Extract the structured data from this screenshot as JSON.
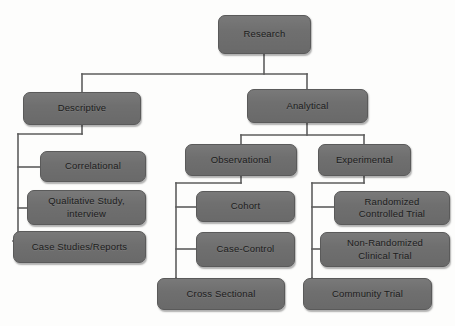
{
  "diagram": {
    "title": "Research",
    "type": "hierarchy-flowchart",
    "style": {
      "node_fill": "#6f6f6f",
      "node_border": "#5a5a5a",
      "connector_color": "#5d5d5d",
      "text_color": "#1c1c1c",
      "background": "#fdfdfc"
    },
    "nodes": [
      {
        "id": "research",
        "label": "Research",
        "level": 0,
        "x": 218,
        "y": 15,
        "w": 93,
        "h": 39
      },
      {
        "id": "descriptive",
        "label": "Descriptive",
        "level": 1,
        "x": 23,
        "y": 92,
        "w": 118,
        "h": 33
      },
      {
        "id": "analytical",
        "label": "Analytical",
        "level": 1,
        "x": 247,
        "y": 89,
        "w": 121,
        "h": 34
      },
      {
        "id": "correlational",
        "label": "Correlational",
        "level": 2,
        "x": 40,
        "y": 151,
        "w": 106,
        "h": 31
      },
      {
        "id": "qualitative",
        "label": "Qualitative Study,\ninterview",
        "line1": "Qualitative Study,",
        "line2": "interview",
        "level": 2,
        "x": 27,
        "y": 190,
        "w": 119,
        "h": 35
      },
      {
        "id": "case-studies",
        "label": "Case Studies/Reports",
        "level": 2,
        "x": 13,
        "y": 231,
        "w": 133,
        "h": 32
      },
      {
        "id": "observational",
        "label": "Observational",
        "level": 2,
        "x": 185,
        "y": 144,
        "w": 112,
        "h": 32
      },
      {
        "id": "experimental",
        "label": "Experimental",
        "level": 2,
        "x": 318,
        "y": 144,
        "w": 93,
        "h": 32
      },
      {
        "id": "cohort",
        "label": "Cohort",
        "level": 3,
        "x": 196,
        "y": 191,
        "w": 99,
        "h": 31
      },
      {
        "id": "case-control",
        "label": "Case-Control",
        "level": 3,
        "x": 196,
        "y": 232,
        "w": 99,
        "h": 35
      },
      {
        "id": "cross-sectional",
        "label": "Cross Sectional",
        "level": 3,
        "x": 157,
        "y": 278,
        "w": 128,
        "h": 32
      },
      {
        "id": "rct",
        "label": "Randomized\nControlled Trial",
        "line1": "Randomized",
        "line2": "Controlled Trial",
        "level": 3,
        "x": 334,
        "y": 191,
        "w": 116,
        "h": 34
      },
      {
        "id": "non-rct",
        "label": "Non-Randomized\nClinical Trial",
        "line1": "Non-Randomized",
        "line2": "Clinical Trial",
        "level": 3,
        "x": 320,
        "y": 232,
        "w": 130,
        "h": 35
      },
      {
        "id": "community-trial",
        "label": "Community Trial",
        "level": 3,
        "x": 303,
        "y": 278,
        "w": 129,
        "h": 32
      }
    ],
    "edges": [
      {
        "from": "research",
        "to": "descriptive"
      },
      {
        "from": "research",
        "to": "analytical"
      },
      {
        "from": "descriptive",
        "to": "correlational"
      },
      {
        "from": "descriptive",
        "to": "qualitative"
      },
      {
        "from": "descriptive",
        "to": "case-studies"
      },
      {
        "from": "analytical",
        "to": "observational"
      },
      {
        "from": "analytical",
        "to": "experimental"
      },
      {
        "from": "observational",
        "to": "cohort"
      },
      {
        "from": "observational",
        "to": "case-control"
      },
      {
        "from": "observational",
        "to": "cross-sectional"
      },
      {
        "from": "experimental",
        "to": "rct"
      },
      {
        "from": "experimental",
        "to": "non-rct"
      },
      {
        "from": "experimental",
        "to": "community-trial"
      }
    ]
  }
}
